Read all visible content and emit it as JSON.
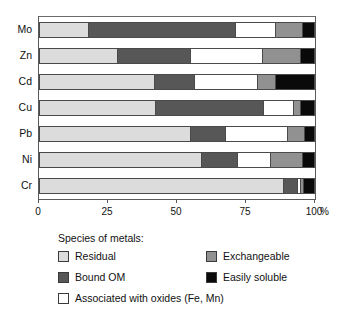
{
  "chart_data": {
    "type": "bar",
    "orientation": "horizontal",
    "stacked": true,
    "normalized_percent": true,
    "title": "",
    "xlabel": "%",
    "ylabel": "",
    "xlim": [
      0,
      100
    ],
    "grid": false,
    "legend_position": "below",
    "x_ticks": [
      {
        "value": 0,
        "label": "0"
      },
      {
        "value": 25,
        "label": "25"
      },
      {
        "value": 50,
        "label": "50"
      },
      {
        "value": 75,
        "label": "75"
      },
      {
        "value": 100,
        "label": "100"
      }
    ],
    "x_unit": "%",
    "categories": [
      "Mo",
      "Zn",
      "Cd",
      "Cu",
      "Pb",
      "Ni",
      "Cr"
    ],
    "series": [
      {
        "name": "Residual",
        "color": "#dcdcdc",
        "values": [
          17.8,
          28.3,
          41.7,
          42.0,
          54.7,
          58.7,
          88.4
        ]
      },
      {
        "name": "Bound OM",
        "color": "#575757",
        "values": [
          53.2,
          26.4,
          14.5,
          39.0,
          12.8,
          13.0,
          5.1
        ]
      },
      {
        "name": "Associated with oxides (Fe, Mn)",
        "color": "#ffffff",
        "values": [
          14.5,
          26.1,
          22.8,
          11.0,
          22.5,
          12.0,
          1.0
        ]
      },
      {
        "name": "Exchangeable",
        "color": "#919191",
        "values": [
          9.8,
          13.7,
          6.5,
          2.5,
          6.0,
          11.6,
          1.2
        ]
      },
      {
        "name": "Easily soluble",
        "color": "#0a0a0a",
        "values": [
          4.7,
          5.5,
          14.5,
          5.5,
          4.0,
          4.7,
          4.3
        ]
      }
    ]
  },
  "legend": {
    "title": "Species of metals:",
    "items": [
      {
        "label": "Residual",
        "color": "#dcdcdc"
      },
      {
        "label": "Bound OM",
        "color": "#575757"
      },
      {
        "label": "Associated with oxides (Fe, Mn)",
        "color": "#ffffff"
      },
      {
        "label": "Exchangeable",
        "color": "#919191"
      },
      {
        "label": "Easily soluble",
        "color": "#0a0a0a"
      }
    ]
  },
  "colors": {
    "residual": "#dcdcdc",
    "bound_om": "#575757",
    "oxides": "#ffffff",
    "exchangeable": "#919191",
    "easily_soluble": "#0a0a0a",
    "axis": "#5a5a5a",
    "outline": "#4a4a4a",
    "text": "#111111",
    "background": "#ffffff"
  }
}
